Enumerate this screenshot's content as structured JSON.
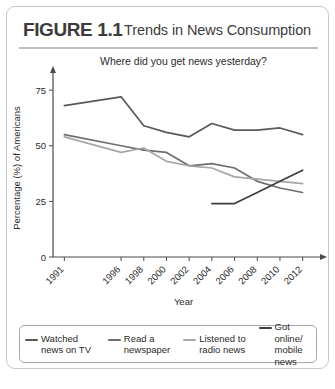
{
  "figure": {
    "number": "FIGURE 1.1",
    "title": "Trends in News Consumption"
  },
  "chart_data": {
    "type": "line",
    "title": "",
    "subtitle": "Where did you get news yesterday?",
    "xlabel": "Year",
    "ylabel": "Percentage (%) of Americans",
    "xlim": [
      1990,
      2013
    ],
    "ylim": [
      0,
      80
    ],
    "yticks": [
      0,
      25,
      50,
      75
    ],
    "xticks": [
      1991,
      1996,
      1998,
      2000,
      2002,
      2004,
      2006,
      2008,
      2010,
      2012
    ],
    "xtick_rotation": 45,
    "grid": false,
    "legend_position": "bottom",
    "series": [
      {
        "name": "Watched\nnews on TV",
        "legend_label": "Watched\nnews on TV",
        "color": "#595959",
        "x": [
          1991,
          1996,
          1998,
          2000,
          2002,
          2004,
          2006,
          2008,
          2010,
          2012
        ],
        "values": [
          68,
          72,
          59,
          56,
          54,
          60,
          57,
          57,
          58,
          55
        ]
      },
      {
        "name": "Read a\nnewspaper",
        "legend_label": "Read a\nnewspaper",
        "color": "#6e6e6e",
        "x": [
          1991,
          1996,
          1998,
          2000,
          2002,
          2004,
          2006,
          2008,
          2010,
          2012
        ],
        "values": [
          55,
          50,
          48,
          47,
          41,
          42,
          40,
          34,
          31,
          29
        ]
      },
      {
        "name": "Listened to\nradio news",
        "legend_label": "Listened to\nradio news",
        "color": "#a6a6a6",
        "x": [
          1991,
          1996,
          1998,
          2000,
          2002,
          2004,
          2006,
          2008,
          2010,
          2012
        ],
        "values": [
          54,
          47,
          49,
          43,
          41,
          40,
          36,
          35,
          34,
          33
        ]
      },
      {
        "name": "Got online/\nmobile news",
        "legend_label": "Got online/\nmobile news",
        "color": "#3d3d3d",
        "x": [
          2004,
          2006,
          2008,
          2010,
          2012
        ],
        "values": [
          24,
          24,
          29,
          34,
          39
        ]
      }
    ]
  }
}
